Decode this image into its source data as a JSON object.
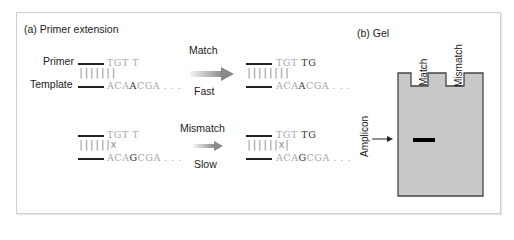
{
  "panel_a": {
    "title": "(a) Primer extension",
    "primer_label": "Primer",
    "template_label": "Template",
    "match": {
      "label": "Match",
      "speed": "Fast",
      "before": {
        "primer": "TGT T",
        "pairs": "|||||||",
        "template_pre": "ACA",
        "template_key": "A",
        "template_post": "CGA . . ."
      },
      "after": {
        "primer_pre": "TGT ",
        "primer_key": "TG",
        "pairs": "||||||||",
        "template_pre": "ACA",
        "template_key": "A",
        "template_post": "CGA . . ."
      }
    },
    "mismatch": {
      "label": "Mismatch",
      "speed": "Slow",
      "before": {
        "primer": "TGT T",
        "pairs": "||||||x",
        "template_pre": "ACA",
        "template_key": "G",
        "template_post": "CGA . . ."
      },
      "after": {
        "primer_pre": "TGT ",
        "primer_key": "TG",
        "pairs": "||||||x|",
        "template_pre": "ACA",
        "template_key": "G",
        "template_post": "CGA . . ."
      }
    }
  },
  "panel_b": {
    "title": "(b) Gel",
    "lanes": [
      "Match",
      "Mismatch"
    ],
    "band_label": "Amplicon",
    "gel_color": "#c8c8c8",
    "band_color": "#000000"
  }
}
